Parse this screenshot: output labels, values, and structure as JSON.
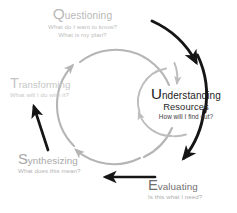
{
  "diagram": {
    "colors": {
      "outer_arc": "#151515",
      "middle_arc": "#b5b5b5",
      "inner_arc": "#bdbdbd",
      "background": "#ffffff",
      "center_text": "#1c1c1c"
    },
    "nodes": {
      "questioning": {
        "cap": "Q",
        "rest": "uestioning",
        "question_line1": "What do I want to know?",
        "question_line2": "What is my plan?"
      },
      "transforming": {
        "cap": "T",
        "rest": "ransforming",
        "question": "What will I do with it?"
      },
      "synthesizing": {
        "cap": "S",
        "rest": "ynthesizing",
        "question": "What does this mean?"
      },
      "evaluating": {
        "cap": "E",
        "rest": "valuating",
        "question": "Is this what I need?"
      },
      "center": {
        "cap": "U",
        "rest": "nderstanding",
        "line2": "Resources",
        "question": "How will I find out?"
      }
    }
  }
}
